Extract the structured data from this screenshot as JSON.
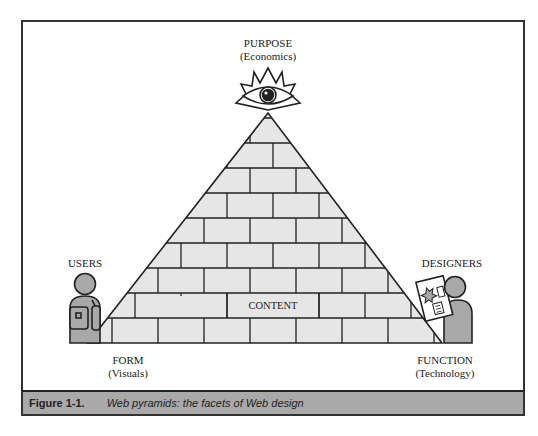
{
  "diagram": {
    "title": "Web pyramids: the facets of Web design",
    "apex": {
      "label": "PURPOSE",
      "sublabel": "(Economics)",
      "icon": "all-seeing-eye-icon"
    },
    "center": {
      "label": "CONTENT"
    },
    "base_left": {
      "label": "FORM",
      "sublabel": "(Visuals)"
    },
    "base_right": {
      "label": "FUNCTION",
      "sublabel": "(Technology)"
    },
    "left_figure": {
      "label": "USERS",
      "icon": "user-with-backpack-icon"
    },
    "right_figure": {
      "label": "DESIGNERS",
      "icon": "designer-with-document-icon"
    },
    "colors": {
      "brick_fill": "#e6e6e6",
      "figure_fill": "#a8a8a8",
      "caption_bg": "#a9a9a9",
      "line": "#222222"
    }
  },
  "caption": {
    "figure_number": "Figure 1-1.",
    "text": "Web pyramids: the facets of Web design"
  }
}
